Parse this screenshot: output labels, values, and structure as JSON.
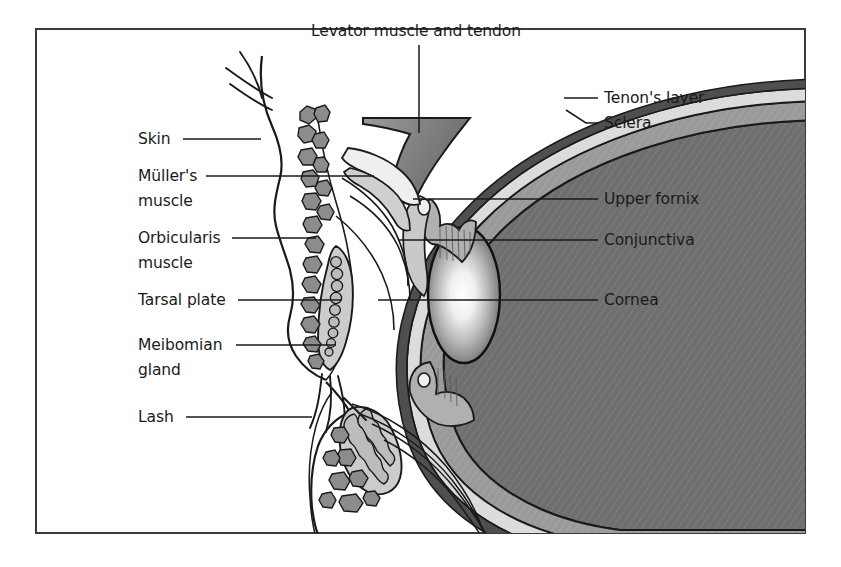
{
  "figure": {
    "title_alt": "Sagittal cross-section of the eyelids and anterior eye globe",
    "frame": {
      "border_color": "#3a3a3a",
      "background": "#ffffff"
    },
    "palette": {
      "outline": "#1a1a1a",
      "globe_fill": "#6f6f6f",
      "sclera_fill": "#9a9a9a",
      "tenon_fill": "#d8d8d8",
      "tenon_outer": "#4a4a4a",
      "muscle_fill": "#8c8c8c",
      "tarsal_fill": "#c9c9c9",
      "gland_fill": "#bdbdbd",
      "conjunctiva_fill": "#b3b3b3",
      "skin_fill": "#fbfbfb",
      "cornea_center": "#ffffff",
      "cornea_edge": "#5f5f5f",
      "leader_color": "#1a1a1a"
    }
  },
  "labels": {
    "top": [
      {
        "id": "levator",
        "text": "Levator muscle and tendon",
        "text_x": 416,
        "text_y": 36,
        "anchor": "middle",
        "leader": "M 419 45 L 419 133"
      }
    ],
    "left": [
      {
        "id": "skin",
        "text": "Skin",
        "text_x": 138,
        "text_y": 144,
        "anchor": "start",
        "leader": "M 183 139 L 253 139"
      },
      {
        "id": "mullers-muscle",
        "text": "Müller's",
        "text2": "muscle",
        "text_x": 138,
        "text_y": 181,
        "text2_y": 206,
        "anchor": "start",
        "leader": "M 206 176 L 374 176"
      },
      {
        "id": "orbicularis-muscle",
        "text": "Orbicularis",
        "text2": "muscle",
        "text_x": 138,
        "text_y": 243,
        "text2_y": 268,
        "anchor": "start",
        "leader": "M 232 238 L 313 238"
      },
      {
        "id": "tarsal-plate",
        "text": "Tarsal plate",
        "text_x": 138,
        "text_y": 305,
        "anchor": "start",
        "leader": "M 238 300 L 340 300"
      },
      {
        "id": "meibomian-gland",
        "text": "Meibomian",
        "text2": "gland",
        "text_x": 138,
        "text_y": 350,
        "text2_y": 375,
        "anchor": "start",
        "leader": "M 236 345 L 336 345"
      },
      {
        "id": "lash",
        "text": "Lash",
        "text_x": 138,
        "text_y": 422,
        "anchor": "start",
        "leader": "M 186 417 L 300 417"
      }
    ],
    "right": [
      {
        "id": "tenons-layer",
        "text": "Tenon's layer",
        "text_x": 604,
        "text_y": 103,
        "anchor": "start",
        "leader": "M 562 98 L 598 98"
      },
      {
        "id": "sclera",
        "text": "Sclera",
        "text_x": 604,
        "text_y": 128,
        "anchor": "start",
        "leader": "M 566 112 L 586 123 L 598 123"
      },
      {
        "id": "upper-fornix",
        "text": "Upper fornix",
        "text_x": 604,
        "text_y": 204,
        "anchor": "start",
        "leader": "M 413 199 L 598 199"
      },
      {
        "id": "conjunctiva",
        "text": "Conjunctiva",
        "text_x": 604,
        "text_y": 245,
        "anchor": "start",
        "leader": "M 398 240 L 598 240"
      },
      {
        "id": "cornea",
        "text": "Cornea",
        "text_x": 604,
        "text_y": 305,
        "anchor": "start",
        "leader": "M 378 300 L 598 300"
      }
    ]
  }
}
